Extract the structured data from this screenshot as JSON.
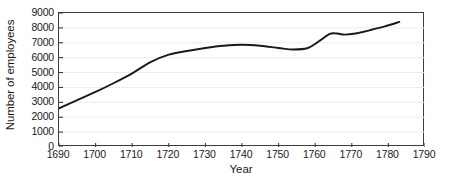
{
  "chart_data": {
    "type": "line",
    "title": "",
    "xlabel": "Year",
    "ylabel": "Number of employees",
    "xlim": [
      1690,
      1790
    ],
    "ylim": [
      0,
      9000
    ],
    "xticks": [
      1690,
      1700,
      1710,
      1720,
      1730,
      1740,
      1750,
      1760,
      1770,
      1780,
      1790
    ],
    "yticks": [
      0,
      1000,
      2000,
      3000,
      4000,
      5000,
      6000,
      7000,
      8000,
      9000
    ],
    "grid": "horizontal",
    "legend": null,
    "line_color": "#1a1a1a",
    "series": [
      {
        "name": "Number of employees",
        "x": [
          1690,
          1695,
          1700,
          1705,
          1710,
          1715,
          1720,
          1725,
          1730,
          1735,
          1740,
          1745,
          1750,
          1754,
          1758,
          1761,
          1764,
          1766,
          1768,
          1771,
          1775,
          1779,
          1783
        ],
        "values": [
          2600,
          3150,
          3700,
          4300,
          4950,
          5700,
          6200,
          6450,
          6650,
          6800,
          6870,
          6800,
          6650,
          6550,
          6650,
          7100,
          7600,
          7620,
          7550,
          7620,
          7850,
          8100,
          8400
        ]
      }
    ]
  },
  "axis_titles": {
    "x": "Year",
    "y": "Number of employees"
  }
}
